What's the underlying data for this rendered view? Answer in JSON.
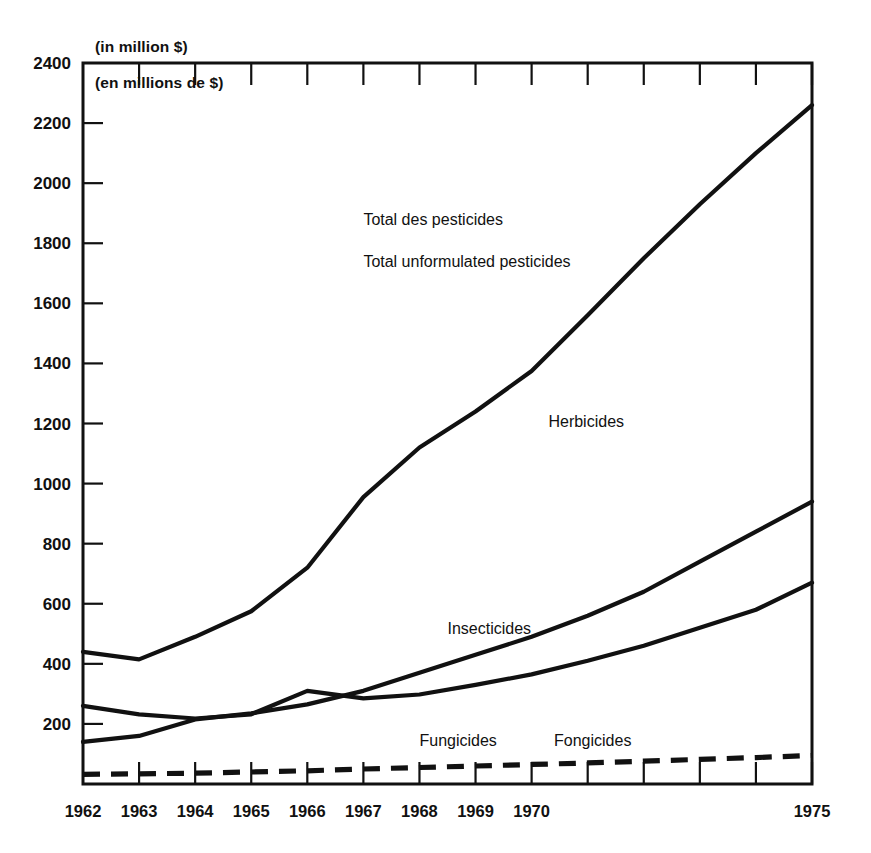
{
  "chart_data": {
    "type": "line",
    "title": "",
    "subtitle": "",
    "unit_note_en": "(in million $)",
    "unit_note_fr": "(en millions de $)",
    "xlabel": "",
    "ylabel": "",
    "ylim": [
      0,
      2400
    ],
    "ytick_values": [
      200,
      400,
      600,
      800,
      1000,
      1200,
      1400,
      1600,
      1800,
      2000,
      2200,
      2400
    ],
    "ytick_labels": [
      "200",
      "400",
      "600",
      "800",
      "1000",
      "1200",
      "1400",
      "1600",
      "1800",
      "2000",
      "2200",
      "2400"
    ],
    "x": [
      1962,
      1963,
      1964,
      1965,
      1966,
      1967,
      1968,
      1969,
      1970,
      1971,
      1972,
      1973,
      1974,
      1975
    ],
    "xtick_labels": [
      "1962",
      "1963",
      "1964",
      "1965",
      "1966",
      "1967",
      "1968",
      "1969",
      "1970",
      "",
      "",
      "",
      "",
      "1975"
    ],
    "xlim": [
      1962,
      1975
    ],
    "grid": false,
    "legend_position": "inline-annotations",
    "series": [
      {
        "name": "Total des pesticides / Total unformulated pesticides",
        "label_line_1": "Total des pesticides",
        "label_line_2": "Total unformulated pesticides",
        "style": "solid",
        "values": [
          440,
          415,
          490,
          575,
          720,
          955,
          1120,
          1240,
          1375,
          1560,
          1750,
          1930,
          2100,
          2260
        ]
      },
      {
        "name": "Herbicides",
        "label_line_1": "Herbicides",
        "label_line_2": "",
        "style": "solid",
        "values": [
          140,
          160,
          215,
          235,
          265,
          310,
          370,
          430,
          490,
          560,
          640,
          740,
          840,
          940
        ]
      },
      {
        "name": "Insecticides",
        "label_line_1": "Insecticides",
        "label_line_2": "",
        "style": "solid",
        "values": [
          260,
          232,
          218,
          232,
          310,
          285,
          298,
          330,
          365,
          410,
          460,
          520,
          580,
          670
        ]
      },
      {
        "name": "Fungicides / Fongicides",
        "label_line_1": "Fungicides",
        "label_line_2": "Fongicides",
        "style": "dashed",
        "values": [
          32,
          34,
          36,
          40,
          44,
          50,
          55,
          60,
          65,
          70,
          76,
          82,
          88,
          95
        ]
      }
    ],
    "annotations": [
      {
        "text": "Total des pesticides",
        "x": 1967.0,
        "y": 1860
      },
      {
        "text": "Total unformulated pesticides",
        "x": 1967.0,
        "y": 1720
      },
      {
        "text": "Herbicides",
        "x": 1970.3,
        "y": 1190
      },
      {
        "text": "Insecticides",
        "x": 1968.5,
        "y": 500
      },
      {
        "text": "Fungicides",
        "x": 1968.0,
        "y": 128
      },
      {
        "text": "Fongicides",
        "x": 1970.4,
        "y": 128
      }
    ],
    "colors": {
      "line": "#111111",
      "axis": "#111111",
      "background": "#ffffff",
      "text": "#111111"
    }
  }
}
